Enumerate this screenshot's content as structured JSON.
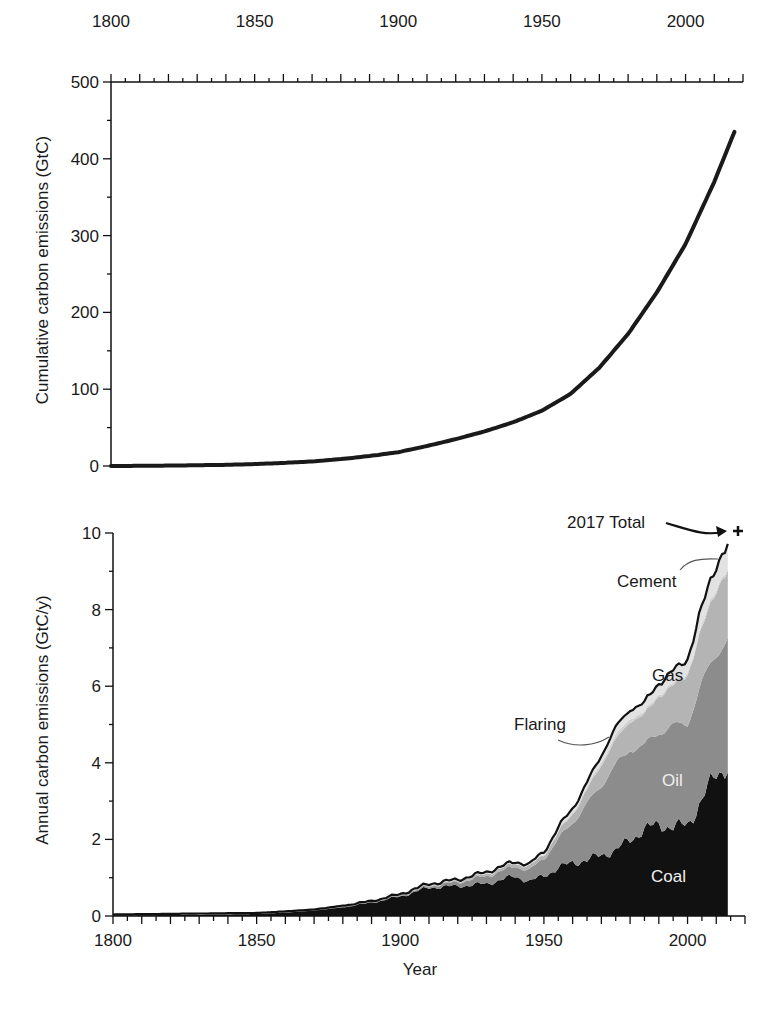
{
  "chart_data": [
    {
      "id": "cumulative",
      "type": "line",
      "title": "",
      "xlabel": "",
      "ylabel": "Cumulative carbon emissions (GtC)",
      "xlim": [
        1800,
        2020
      ],
      "ylim": [
        0,
        500
      ],
      "x_ticks": [
        1800,
        1850,
        1900,
        1950,
        2000
      ],
      "y_ticks": [
        0,
        100,
        200,
        300,
        400,
        500
      ],
      "x_axis_position": "top",
      "grid": false,
      "legend": null,
      "series": [
        {
          "name": "Cumulative emissions",
          "x": [
            1800,
            1820,
            1840,
            1850,
            1860,
            1870,
            1880,
            1890,
            1900,
            1910,
            1920,
            1930,
            1940,
            1950,
            1960,
            1970,
            1980,
            1990,
            2000,
            2010,
            2017
          ],
          "values": [
            0,
            0.5,
            1.5,
            2.5,
            4,
            6,
            9,
            13,
            18,
            26,
            35,
            45,
            57,
            72,
            94,
            128,
            172,
            226,
            289,
            370,
            435
          ]
        }
      ]
    },
    {
      "id": "annual",
      "type": "area",
      "stacked": true,
      "title": "",
      "xlabel": "Year",
      "ylabel": "Annual carbon emissions (GtC/y)",
      "xlim": [
        1800,
        2020
      ],
      "ylim": [
        0,
        10
      ],
      "x_ticks": [
        1800,
        1850,
        1900,
        1950,
        2000
      ],
      "y_ticks": [
        0,
        2,
        4,
        6,
        8,
        10
      ],
      "grid": false,
      "legend": null,
      "x": [
        1800,
        1850,
        1860,
        1870,
        1880,
        1890,
        1900,
        1910,
        1920,
        1930,
        1940,
        1945,
        1950,
        1955,
        1960,
        1965,
        1970,
        1975,
        1980,
        1985,
        1990,
        1995,
        2000,
        2005,
        2010,
        2014
      ],
      "series": [
        {
          "name": "Coal",
          "color": "#111111",
          "values": [
            0.01,
            0.05,
            0.09,
            0.14,
            0.23,
            0.35,
            0.51,
            0.74,
            0.78,
            0.84,
            1.04,
            0.9,
            1.05,
            1.25,
            1.4,
            1.45,
            1.6,
            1.7,
            2.0,
            2.25,
            2.4,
            2.3,
            2.4,
            3.0,
            3.75,
            3.9
          ]
        },
        {
          "name": "Oil",
          "color": "#8c8c8c",
          "values": [
            0,
            0,
            0,
            0,
            0.01,
            0.01,
            0.02,
            0.04,
            0.1,
            0.2,
            0.25,
            0.3,
            0.45,
            0.75,
            1.05,
            1.45,
            1.85,
            2.2,
            2.4,
            2.15,
            2.45,
            2.6,
            2.7,
            3.0,
            3.2,
            3.3
          ]
        },
        {
          "name": "Gas",
          "color": "#b4b4b4",
          "values": [
            0,
            0,
            0,
            0,
            0,
            0,
            0.01,
            0.02,
            0.03,
            0.06,
            0.08,
            0.1,
            0.1,
            0.17,
            0.24,
            0.35,
            0.55,
            0.65,
            0.75,
            0.8,
            0.95,
            1.05,
            1.25,
            1.45,
            1.65,
            1.8
          ]
        },
        {
          "name": "Flaring",
          "color": "#d0d0d0",
          "values": [
            0,
            0,
            0,
            0,
            0,
            0,
            0,
            0,
            0,
            0,
            0,
            0,
            0.02,
            0.03,
            0.04,
            0.06,
            0.08,
            0.1,
            0.09,
            0.06,
            0.06,
            0.06,
            0.06,
            0.07,
            0.07,
            0.07
          ]
        },
        {
          "name": "Cement",
          "color": "#e2e2e2",
          "values": [
            0,
            0,
            0,
            0,
            0,
            0,
            0,
            0.01,
            0.01,
            0.02,
            0.02,
            0.02,
            0.04,
            0.06,
            0.08,
            0.1,
            0.14,
            0.18,
            0.2,
            0.21,
            0.25,
            0.3,
            0.33,
            0.45,
            0.55,
            0.58
          ]
        }
      ],
      "total_line": {
        "name": "Total",
        "color": "#111111",
        "values": [
          0.01,
          0.05,
          0.09,
          0.14,
          0.24,
          0.36,
          0.54,
          0.81,
          0.92,
          1.12,
          1.39,
          1.32,
          1.66,
          2.26,
          2.81,
          3.41,
          4.22,
          4.83,
          5.44,
          5.47,
          6.11,
          6.31,
          6.74,
          7.97,
          9.22,
          9.75
        ]
      },
      "point_annotations": [
        {
          "label": "2017 Total",
          "x": 2017,
          "y": 10.0,
          "marker": "+"
        }
      ],
      "layer_labels": [
        {
          "label": "Coal",
          "x": 1995,
          "y": 1.1,
          "color": "#f0f0f0"
        },
        {
          "label": "Oil",
          "x": 1990,
          "y": 3.4,
          "color": "#f0f0f0"
        },
        {
          "label": "Gas",
          "x": 1986,
          "y": 5.8,
          "color": "#1a1a1a"
        },
        {
          "label": "Flaring",
          "x": 1950,
          "y": 4.5,
          "color": "#1a1a1a",
          "leader": true
        },
        {
          "label": "Cement",
          "x": 1985,
          "y": 8.2,
          "color": "#1a1a1a",
          "leader": true
        }
      ]
    }
  ],
  "labels": {
    "top_ylabel": "Cumulative carbon emissions (GtC)",
    "bottom_ylabel": "Annual carbon emissions (GtC/y)",
    "bottom_xlabel": "Year",
    "annot_total": "2017 Total",
    "annot_cement": "Cement",
    "annot_flaring": "Flaring",
    "annot_gas": "Gas",
    "annot_oil": "Oil",
    "annot_coal": "Coal"
  }
}
